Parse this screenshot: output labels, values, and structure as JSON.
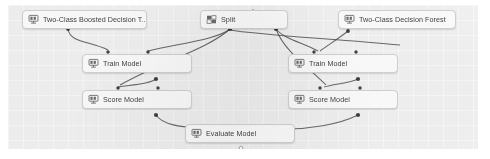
{
  "app": {
    "title": "ML Pipeline Canvas",
    "canvas_background": "#f2f2f2",
    "node_background": "#fdfdfd",
    "node_border": "#d2d2d2",
    "edge_color": "#4a4a4a",
    "text_color": "#2f2f2f"
  },
  "nodes": [
    {
      "id": "boosted-decision-tree",
      "label": "Two-Class Boosted Decision T..",
      "icon": "model-algorithm-icon",
      "x": 22,
      "y": 10,
      "w": 125,
      "h": 19
    },
    {
      "id": "split",
      "label": "Split",
      "icon": "split-data-icon",
      "x": 200,
      "y": 10,
      "w": 88,
      "h": 19
    },
    {
      "id": "decision-forest",
      "label": "Two-Class Decision Forest",
      "icon": "model-algorithm-icon",
      "x": 338,
      "y": 10,
      "w": 118,
      "h": 19
    },
    {
      "id": "train-model-left",
      "label": "Train Model",
      "icon": "train-model-icon",
      "x": 82,
      "y": 54,
      "w": 110,
      "h": 19
    },
    {
      "id": "train-model-right",
      "label": "Train Model",
      "icon": "train-model-icon",
      "x": 288,
      "y": 54,
      "w": 110,
      "h": 19
    },
    {
      "id": "score-model-left",
      "label": "Score Model",
      "icon": "score-model-icon",
      "x": 82,
      "y": 90,
      "w": 110,
      "h": 19
    },
    {
      "id": "score-model-right",
      "label": "Score Model",
      "icon": "score-model-icon",
      "x": 288,
      "y": 90,
      "w": 110,
      "h": 19
    },
    {
      "id": "evaluate-model",
      "label": "Evaluate Model",
      "icon": "evaluate-model-icon",
      "x": 185,
      "y": 124,
      "w": 110,
      "h": 19
    }
  ],
  "edges": [
    {
      "from": "boosted-decision-tree",
      "to": "train-model-left"
    },
    {
      "from": "split",
      "to": "train-model-left"
    },
    {
      "from": "split",
      "to": "score-model-left"
    },
    {
      "from": "split",
      "to": "train-model-right"
    },
    {
      "from": "split",
      "to": "score-model-right"
    },
    {
      "from": "decision-forest",
      "to": "train-model-right"
    },
    {
      "from": "train-model-left",
      "to": "score-model-left"
    },
    {
      "from": "train-model-right",
      "to": "score-model-right"
    },
    {
      "from": "score-model-left",
      "to": "evaluate-model"
    },
    {
      "from": "score-model-right",
      "to": "evaluate-model"
    }
  ]
}
